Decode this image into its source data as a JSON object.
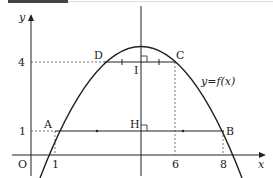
{
  "figure": {
    "axes": {
      "x_label": "x",
      "y_label": "y",
      "origin_label": "O"
    },
    "y_ticks": [
      {
        "value": "4"
      },
      {
        "value": "1"
      }
    ],
    "x_ticks": [
      {
        "value": "1"
      },
      {
        "value": "6"
      },
      {
        "value": "8"
      }
    ],
    "points": {
      "A": "A",
      "B": "B",
      "C": "C",
      "D": "D",
      "H": "H",
      "I": "I"
    },
    "curve_label": "y=f(x)",
    "colors": {
      "stroke": "#222222",
      "dashed": "#555555"
    }
  }
}
